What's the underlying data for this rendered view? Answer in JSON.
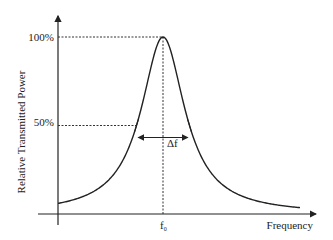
{
  "chart_data": {
    "type": "line",
    "title": "",
    "xlabel": "Frequency",
    "ylabel": "Relative Transmitted Power",
    "center_label": "f",
    "center_subscript": "0",
    "bandwidth_label": "Δf",
    "y_ticks": [
      {
        "label": "100%",
        "value": 1.0
      },
      {
        "label": "50%",
        "value": 0.5
      }
    ],
    "ylim": [
      0,
      1.0
    ],
    "curve": {
      "shape": "lorentzian-like resonance peak",
      "peak_value": 1.0,
      "half_power_value": 0.5,
      "center": 0,
      "half_width": 1
    },
    "annotations": [
      "dashed line from 100% tick to peak",
      "dashed vertical line from peak to f0",
      "dashed line from 50% tick to left half-power point",
      "double-headed arrow Δf between half-power points"
    ]
  }
}
